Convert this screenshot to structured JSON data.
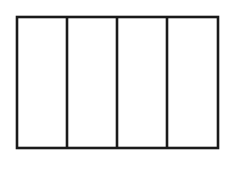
{
  "diagram": {
    "type": "partitioned-rectangle",
    "parts": 4,
    "orientation": "vertical",
    "shaded_parts": 0,
    "stroke_color": "#1a1a1a",
    "fill_color": "#ffffff",
    "background_color": "#ffffff",
    "bounds": {
      "x": 17,
      "y": 17,
      "width": 201,
      "height": 131
    },
    "divider_x": [
      67,
      117,
      167
    ]
  }
}
